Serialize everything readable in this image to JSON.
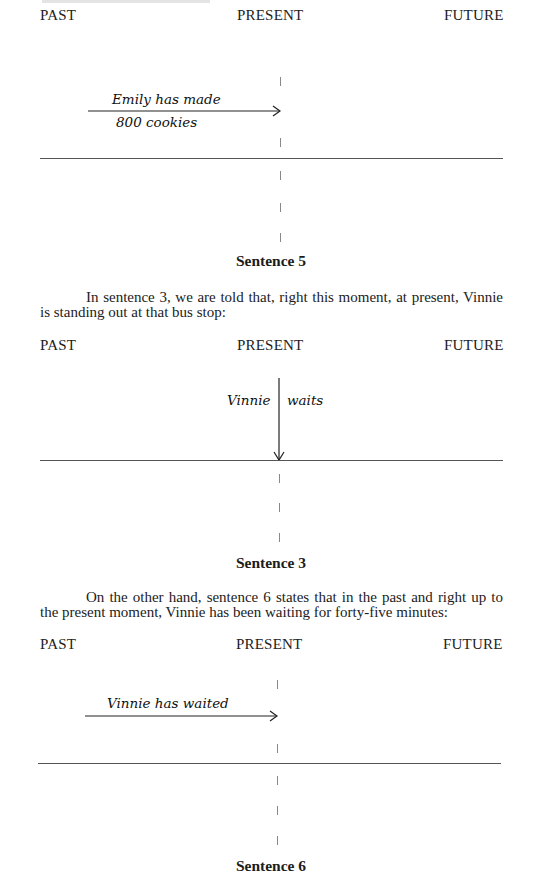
{
  "timeline_labels": {
    "past": "PAST",
    "present": "PRESENT",
    "future": "FUTURE"
  },
  "diagrams": [
    {
      "caption": "Sentence 5",
      "handwriting": [
        "Emily has made",
        "800 cookies"
      ],
      "arrow": "horizontal arrow from the past ending at the present"
    },
    {
      "caption": "Sentence 3",
      "handwriting": [
        "Vinnie",
        "waits"
      ],
      "arrow": "vertical arrow pointing down onto the present"
    },
    {
      "caption": "Sentence 6",
      "handwriting": [
        "Vinnie has waited"
      ],
      "arrow": "horizontal arrow from the past ending at the present"
    }
  ],
  "paragraphs": [
    "In sentence 3, we are told that, right this moment, at present, Vinnie is standing out at that bus stop:",
    "On the other hand, sentence 6 states that in the past and right up to the present moment, Vinnie has been waiting for forty-five minutes:"
  ]
}
